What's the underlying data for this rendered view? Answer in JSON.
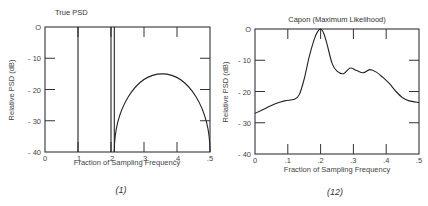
{
  "chart_data": [
    {
      "type": "line",
      "title": "True PSD",
      "caption": "(1)",
      "xlabel": "Fraction of Sampling Frequency",
      "ylabel": "Relative PSD (dB)",
      "xlim": [
        0,
        0.5
      ],
      "ylim": [
        -40,
        0
      ],
      "xticks": [
        0,
        0.1,
        0.2,
        0.3,
        0.4,
        0.5
      ],
      "xtick_labels": [
        "0",
        ".1",
        ".2",
        ".3",
        ".4",
        ".5"
      ],
      "yticks": [
        0,
        -10,
        -20,
        -30,
        -40
      ],
      "ytick_labels": [
        "O",
        "- 10",
        "- 20",
        "- 30",
        "- 40"
      ],
      "grid": false,
      "series": [
        {
          "name": "line spectrum 1",
          "kind": "vline",
          "x": 0.1,
          "from": -40,
          "to": 0
        },
        {
          "name": "line spectrum 2",
          "kind": "vline",
          "x": 0.2,
          "from": -40,
          "to": 0
        },
        {
          "name": "line spectrum 3",
          "kind": "vline",
          "x": 0.21,
          "from": -40,
          "to": 0
        },
        {
          "name": "broadband",
          "kind": "ellipse-arc",
          "x_start": 0.21,
          "x_end": 0.5,
          "peak_x": 0.355,
          "peak_y": -15,
          "base_y": -40
        }
      ]
    },
    {
      "type": "line",
      "title": "Capon (Maximum Likelihood)",
      "caption": "(12)",
      "xlabel": "Fraction of Sampling Frequency",
      "ylabel": "Relative PSD (dB)",
      "xlim": [
        0,
        0.5
      ],
      "ylim": [
        -40,
        0
      ],
      "xticks": [
        0,
        0.1,
        0.2,
        0.3,
        0.4,
        0.5
      ],
      "xtick_labels": [
        "0",
        ".1",
        ".2",
        ".3",
        ".4",
        ".5"
      ],
      "yticks": [
        0,
        -10,
        -20,
        -30,
        -40
      ],
      "ytick_labels": [
        "O",
        "- 10",
        "- 20",
        "- 30",
        "- 40"
      ],
      "grid": false,
      "series": [
        {
          "name": "Capon estimate",
          "x": [
            0,
            0.03,
            0.06,
            0.09,
            0.12,
            0.135,
            0.15,
            0.165,
            0.18,
            0.19,
            0.2,
            0.21,
            0.22,
            0.235,
            0.25,
            0.27,
            0.29,
            0.31,
            0.33,
            0.35,
            0.37,
            0.39,
            0.41,
            0.43,
            0.45,
            0.47,
            0.5
          ],
          "y": [
            -27,
            -25.5,
            -24,
            -23,
            -22.5,
            -21,
            -16,
            -9,
            -3.5,
            -1,
            0,
            -1.5,
            -5,
            -11,
            -13.5,
            -14.3,
            -12.5,
            -13.3,
            -14,
            -13,
            -13.8,
            -15.5,
            -17.5,
            -20,
            -22,
            -23,
            -23.5
          ]
        }
      ]
    }
  ]
}
